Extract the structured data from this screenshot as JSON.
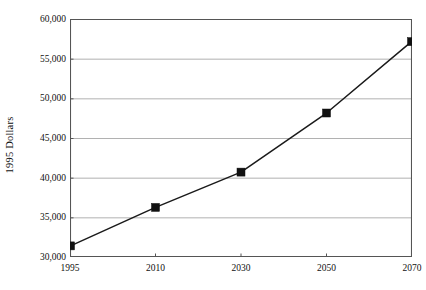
{
  "chart_data": {
    "type": "line",
    "title": "",
    "xlabel": "",
    "ylabel": "1995 Dollars",
    "categories": [
      "1995",
      "2010",
      "2030",
      "2050",
      "2070"
    ],
    "x": [
      1995,
      2010,
      2030,
      2050,
      2070
    ],
    "values": [
      31400,
      36250,
      40700,
      48150,
      57150
    ],
    "series": [
      {
        "name": "1995 Dollars",
        "values": [
          31400,
          36250,
          40700,
          48150,
          57150
        ]
      }
    ],
    "ylim": [
      30000,
      60000
    ],
    "ytick_values": [
      30000,
      35000,
      40000,
      45000,
      50000,
      55000,
      60000
    ],
    "ytick_labels": [
      "30,000",
      "35,000",
      "40,000",
      "45,000",
      "50,000",
      "55,000",
      "60,000"
    ],
    "xtick_labels": [
      "1995",
      "2010",
      "2030",
      "2050",
      "2070"
    ],
    "grid": "horizontal",
    "legend": "none",
    "marker": "filled-square",
    "line_color": "#1a1a1a",
    "marker_color": "#111111",
    "grid_color": "#a8a8a8",
    "axis_color": "#555555",
    "background_color": "#ffffff"
  },
  "axis": {
    "y_title": "1995 Dollars"
  }
}
